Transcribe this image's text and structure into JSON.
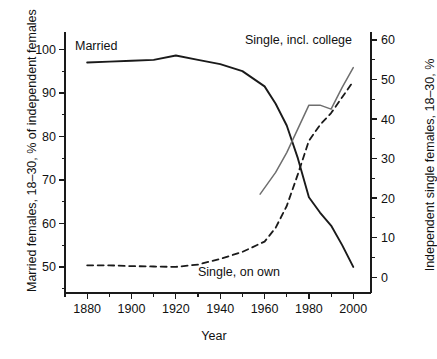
{
  "chart_data": {
    "type": "line",
    "title": "",
    "xlabel": "Year",
    "ylabel_left": "Married females, 18–30, % of independent females",
    "ylabel_right": "Independent single females, 18–30, %",
    "xlim": [
      1870,
      2008
    ],
    "xticks": [
      1880,
      1900,
      1920,
      1940,
      1960,
      1980,
      2000
    ],
    "xticklabels": [
      "1880",
      "1900",
      "1920",
      "1940",
      "1960",
      "1980",
      "2000"
    ],
    "xminorticks": [
      1870,
      1890,
      1910,
      1930,
      1950,
      1970,
      1990
    ],
    "ylim_left": [
      44,
      104
    ],
    "yticks_left": [
      50,
      60,
      70,
      80,
      90,
      100
    ],
    "yticklabels_left": [
      "50",
      "60",
      "70",
      "80",
      "90",
      "100"
    ],
    "yminorticks_left": [
      45,
      55,
      65,
      75,
      85,
      95
    ],
    "ylim_right": [
      -4,
      62
    ],
    "yticks_right": [
      0,
      10,
      20,
      30,
      40,
      50,
      60
    ],
    "yticklabels_right": [
      "0",
      "10",
      "20",
      "30",
      "40",
      "50",
      "60"
    ],
    "yminorticks_right": [
      5,
      15,
      25,
      35,
      45,
      55
    ],
    "grid": false,
    "legend_position": "inline-annotations",
    "series": [
      {
        "name": "Married",
        "axis": "left",
        "style": "solid",
        "color": "#1a1a1a",
        "width": 1.9,
        "x": [
          1880,
          1890,
          1900,
          1910,
          1920,
          1930,
          1940,
          1950,
          1960,
          1965,
          1970,
          1975,
          1980,
          1985,
          1990,
          1995,
          2000
        ],
        "values": [
          97.0,
          97.2,
          97.4,
          97.6,
          98.6,
          97.6,
          96.6,
          95.0,
          91.5,
          87.5,
          82.5,
          75.0,
          66.0,
          62.5,
          59.5,
          55.0,
          50.0
        ]
      },
      {
        "name": "Single, on own",
        "axis": "right",
        "style": "dashed",
        "color": "#1a1a1a",
        "width": 1.8,
        "x": [
          1880,
          1890,
          1900,
          1910,
          1920,
          1930,
          1940,
          1950,
          1960,
          1965,
          1970,
          1975,
          1980,
          1985,
          1990,
          1995,
          2000
        ],
        "values": [
          3.0,
          3.0,
          2.8,
          2.7,
          2.6,
          3.2,
          4.6,
          6.4,
          9.0,
          12.5,
          18.0,
          26.0,
          34.5,
          38.5,
          41.5,
          45.5,
          49.5
        ]
      },
      {
        "name": "Single, incl. college",
        "axis": "right",
        "style": "solid",
        "color": "#6e6e6e",
        "width": 1.5,
        "x": [
          1958,
          1965,
          1970,
          1975,
          1980,
          1985,
          1990,
          1995,
          2000
        ],
        "values": [
          21.0,
          26.5,
          31.5,
          37.5,
          43.5,
          43.5,
          42.5,
          48.0,
          53.0
        ]
      }
    ],
    "annotations": [
      {
        "text": "Married",
        "x_px": 75,
        "y_px": 50,
        "name": "married-label"
      },
      {
        "text": "Single, incl. college",
        "x_px": 245,
        "y_px": 44,
        "name": "single-incl-college-label"
      },
      {
        "text": "Single, on own",
        "x_px": 198,
        "y_px": 276,
        "name": "single-on-own-label"
      }
    ]
  }
}
